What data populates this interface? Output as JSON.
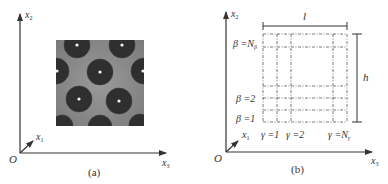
{
  "figure": {
    "panels": [
      {
        "id": "a",
        "caption": "(a)",
        "axes": {
          "origin": "O",
          "x1": "x",
          "x1_sub": "1",
          "x2": "x",
          "x2_sub": "2",
          "x3": "x",
          "x3_sub": "3"
        },
        "image": "micrograph of periodic array of dark circular inclusions each with a bright center dot"
      },
      {
        "id": "b",
        "caption": "(b)",
        "axes": {
          "origin": "O",
          "x1": "x",
          "x1_sub": "1",
          "x2": "x",
          "x2_sub": "2",
          "x3": "x",
          "x3_sub": "3"
        },
        "dimensions": {
          "width_label": "l",
          "height_label": "h"
        },
        "row_labels": [
          {
            "text": "β =N",
            "sub": "β"
          },
          {
            "text": "β =2",
            "sub": ""
          },
          {
            "text": "β =1",
            "sub": ""
          }
        ],
        "column_labels": [
          {
            "text": "γ =1",
            "sub": ""
          },
          {
            "text": "γ =2",
            "sub": ""
          },
          {
            "text": "γ =N",
            "sub": "γ"
          }
        ]
      }
    ],
    "colors": {
      "axis": "#333333",
      "grid_line": "#666666",
      "inclusion_dark": "#2e2e2e",
      "matrix_gray": "#8a8a8a"
    }
  }
}
